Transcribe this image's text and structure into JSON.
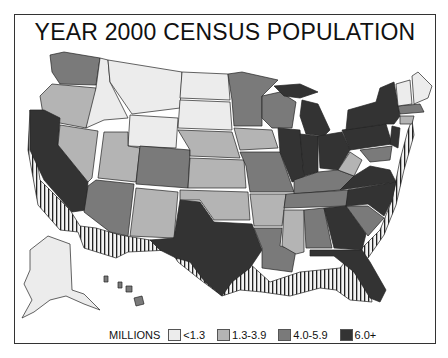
{
  "title": "YEAR 2000 CENSUS POPULATION",
  "legend": {
    "label": "MILLIONS",
    "items": [
      {
        "range": "<1.3",
        "color": "#ececec"
      },
      {
        "range": "1.3-3.9",
        "color": "#b4b4b4"
      },
      {
        "range": "4.0-5.9",
        "color": "#7a7a7a"
      },
      {
        "range": "6.0+",
        "color": "#333333"
      }
    ]
  },
  "colors": {
    "low": "#ececec",
    "midlow": "#b4b4b4",
    "midhigh": "#7a7a7a",
    "high": "#333333",
    "extrusion": "#f4f4f4",
    "border": "#222222"
  }
}
